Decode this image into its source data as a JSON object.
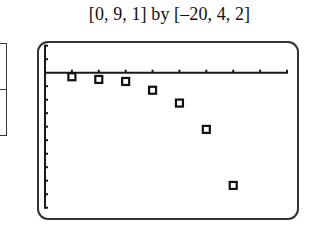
{
  "window": {
    "title": "[0, 9, 1] by [–20, 4, 2]"
  },
  "chart_data": {
    "type": "scatter",
    "title": "[0, 9, 1] by [–20, 4, 2]",
    "xlabel": "",
    "ylabel": "",
    "xlim": [
      0,
      9
    ],
    "ylim": [
      -20,
      4
    ],
    "xscl": 1,
    "yscl": 2,
    "grid": false,
    "marker": "hollow-square",
    "x": [
      1,
      2,
      3,
      4,
      5,
      6,
      7
    ],
    "y": [
      -0.6,
      -1.0,
      -1.3,
      -2.6,
      -4.5,
      -8.4,
      -16.7
    ]
  },
  "colors": {
    "axis": "#1a1a1a",
    "marker": "#111111",
    "frame": "#333333"
  }
}
